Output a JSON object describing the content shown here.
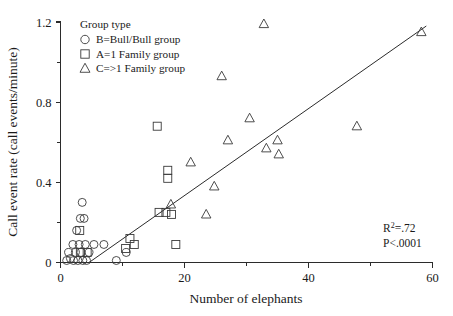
{
  "chart_data": {
    "type": "scatter",
    "title": "",
    "xlabel": "Number of elephants",
    "ylabel": "Call event rate (call events/minute)",
    "xlim": [
      0,
      60
    ],
    "ylim": [
      0,
      1.2
    ],
    "xticks": [
      "0",
      "20",
      "40",
      "60"
    ],
    "xtick_values": [
      0,
      20,
      40,
      60
    ],
    "xminor_values": [
      10,
      30,
      50
    ],
    "yticks": [
      "0",
      "0.4",
      "0.8",
      "1.2"
    ],
    "ytick_values": [
      0,
      0.4,
      0.8,
      1.2
    ],
    "yminor_values": [
      0.2,
      0.6,
      1.0
    ],
    "grid": false,
    "legend_position": "top-left",
    "legend_title": "Group type",
    "series": [
      {
        "name": "B=Bull/Bull group",
        "marker": "circle",
        "points": [
          [
            1.0,
            0.01
          ],
          [
            1.3,
            0.05
          ],
          [
            1.6,
            0.02
          ],
          [
            2.0,
            0.09
          ],
          [
            2.1,
            0.01
          ],
          [
            2.4,
            0.05
          ],
          [
            2.6,
            0.16
          ],
          [
            2.8,
            0.01
          ],
          [
            3.0,
            0.09
          ],
          [
            3.2,
            0.22
          ],
          [
            3.3,
            0.05
          ],
          [
            3.5,
            0.3
          ],
          [
            3.6,
            0.01
          ],
          [
            3.8,
            0.22
          ],
          [
            4.0,
            0.09
          ],
          [
            4.2,
            0.01
          ],
          [
            4.6,
            0.05
          ],
          [
            5.4,
            0.09
          ],
          [
            7.0,
            0.09
          ],
          [
            9.0,
            0.01
          ],
          [
            10.6,
            0.05
          ]
        ]
      },
      {
        "name": "A=1 Family group",
        "marker": "square",
        "points": [
          [
            3.1,
            0.16
          ],
          [
            3.2,
            0.05
          ],
          [
            4.3,
            0.05
          ],
          [
            10.5,
            0.07
          ],
          [
            11.2,
            0.12
          ],
          [
            11.9,
            0.09
          ],
          [
            15.6,
            0.68
          ],
          [
            15.9,
            0.25
          ],
          [
            17.0,
            0.25
          ],
          [
            17.3,
            0.46
          ],
          [
            17.3,
            0.42
          ],
          [
            17.9,
            0.24
          ],
          [
            18.6,
            0.09
          ]
        ]
      },
      {
        "name": "C=>1 Family group",
        "marker": "triangle",
        "points": [
          [
            17.8,
            0.29
          ],
          [
            21.0,
            0.5
          ],
          [
            23.5,
            0.24
          ],
          [
            24.8,
            0.38
          ],
          [
            26.0,
            0.93
          ],
          [
            27.0,
            0.61
          ],
          [
            30.5,
            0.72
          ],
          [
            32.8,
            1.19
          ],
          [
            33.2,
            0.57
          ],
          [
            35.0,
            0.61
          ],
          [
            35.2,
            0.54
          ],
          [
            47.8,
            0.68
          ],
          [
            58.2,
            1.15
          ]
        ]
      }
    ],
    "fit_line": {
      "x_start": 4.6,
      "y_start": 0.0,
      "x_end": 59.0,
      "y_end": 1.18
    },
    "annotations": [
      {
        "text": "R²=.72",
        "base": "R",
        "sup": "2",
        "rest": "=.72"
      },
      {
        "text": "P<.0001"
      }
    ]
  },
  "legend": {
    "title": "Group type",
    "items": [
      {
        "marker": "circle",
        "label": "B=Bull/Bull group"
      },
      {
        "marker": "square",
        "label": "A=1 Family group"
      },
      {
        "marker": "triangle",
        "label": "C=>1 Family group"
      }
    ]
  },
  "annotations": {
    "r_squared_base": "R",
    "r_squared_sup": "2",
    "r_squared_rest": "=.72",
    "p_value": "P<.0001"
  },
  "colors": {
    "marker_stroke": "#3a3a3a",
    "axis": "#2b2b2b",
    "text": "#1a1a1a",
    "background": "#ffffff"
  }
}
